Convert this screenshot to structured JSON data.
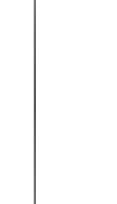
{
  "canvas": {
    "width": 117,
    "height": 204,
    "background_color": "#ffffff",
    "description": "Blank white field crossed by a single thin vertical rule"
  },
  "divider": {
    "name": "vertical-divider",
    "orientation": "vertical",
    "x_position": 34,
    "thickness": 1.6,
    "top": 0,
    "bottom": 204,
    "spans_full_height": true,
    "color": "#5f5f5f",
    "color_top": "#7a7a7a",
    "color_middle": "#565656",
    "color_bottom": "#737373",
    "fringe_color": "#d9d9d9"
  },
  "regions": {
    "left_panel": {
      "name": "left-blank-region",
      "x": 0,
      "width": 34,
      "background_color": "#ffffff",
      "content": ""
    },
    "right_panel": {
      "name": "right-blank-region",
      "x": 36,
      "width": 81,
      "background_color": "#ffffff",
      "content": ""
    }
  }
}
